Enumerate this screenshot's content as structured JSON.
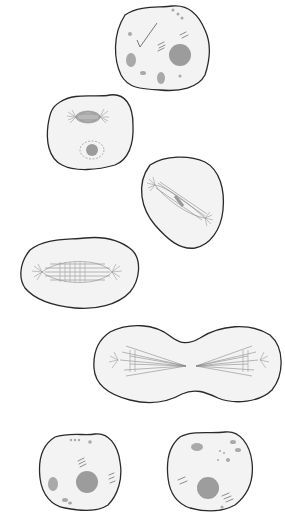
{
  "figure": {
    "stages": [
      {
        "id": "interphase",
        "label": ""
      },
      {
        "id": "prophase",
        "label": ""
      },
      {
        "id": "prometaphase",
        "label": ""
      },
      {
        "id": "metaphase",
        "label": ""
      },
      {
        "id": "anaphase-telophase",
        "label": ""
      },
      {
        "id": "daughter-cell-left",
        "label": ""
      },
      {
        "id": "daughter-cell-right",
        "label": ""
      }
    ],
    "colors": {
      "background": "#ffffff",
      "cytoplasm": "#f3f3f3",
      "membrane": "#2a2a2a",
      "structures": "#9c9c9c"
    }
  }
}
